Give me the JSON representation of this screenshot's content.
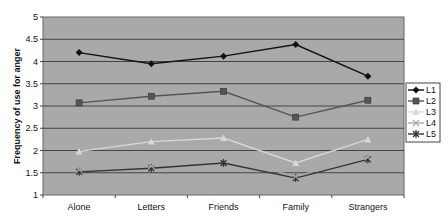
{
  "chart_data": {
    "type": "line",
    "title": "",
    "xlabel": "",
    "ylabel": "Frequency of use for anger",
    "categories": [
      "Alone",
      "Letters",
      "Friends",
      "Family",
      "Strangers"
    ],
    "ylim": [
      1,
      5
    ],
    "yticks": [
      "1",
      "1.5",
      "2",
      "2.5",
      "3",
      "3.5",
      "4",
      "4.5",
      "5"
    ],
    "grid": true,
    "legend_position": "right",
    "series": [
      {
        "name": "L1",
        "color": "#111111",
        "marker": "diamond",
        "values": [
          4.2,
          3.95,
          4.12,
          4.38,
          3.67
        ]
      },
      {
        "name": "L2",
        "color": "#555555",
        "marker": "square",
        "values": [
          3.07,
          3.22,
          3.33,
          2.75,
          3.13
        ]
      },
      {
        "name": "L3",
        "color": "#d8d8d8",
        "marker": "triangle",
        "values": [
          1.98,
          2.2,
          2.28,
          1.72,
          2.25
        ]
      },
      {
        "name": "L4",
        "color": "#a8a8a8",
        "marker": "x",
        "values": [
          1.57,
          1.65,
          1.85,
          1.42,
          1.85
        ]
      },
      {
        "name": "L5",
        "color": "#333333",
        "marker": "star",
        "values": [
          1.52,
          1.6,
          1.72,
          1.38,
          1.8
        ]
      }
    ],
    "plot_background": "#a9a9a9"
  }
}
